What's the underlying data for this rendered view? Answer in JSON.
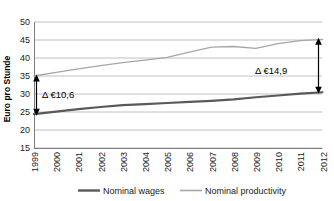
{
  "chart_data": {
    "type": "line",
    "title": "",
    "xlabel": "",
    "ylabel": "Euro pro Stunde",
    "ylim": [
      15,
      50
    ],
    "yticks": [
      15,
      20,
      25,
      30,
      35,
      40,
      45,
      50
    ],
    "grid": true,
    "legend_position": "bottom",
    "categories": [
      "1999",
      "2000",
      "2001",
      "2002",
      "2003",
      "2004",
      "2005",
      "2006",
      "2007",
      "2008",
      "2009",
      "2010",
      "2011",
      "2012"
    ],
    "series": [
      {
        "name": "Nominal wages",
        "color": "#595959",
        "values": [
          24.4,
          25.1,
          25.8,
          26.4,
          26.9,
          27.2,
          27.5,
          27.8,
          28.1,
          28.5,
          29.1,
          29.6,
          30.1,
          30.5
        ]
      },
      {
        "name": "Nominal productivity",
        "color": "#a6a6a6",
        "values": [
          35.0,
          36.0,
          37.0,
          37.9,
          38.7,
          39.4,
          40.2,
          41.6,
          43.0,
          43.2,
          42.7,
          44.0,
          44.8,
          45.2
        ]
      }
    ],
    "annotations": [
      {
        "name": "gap-1999",
        "text": "Δ €10,6",
        "value": 10.6,
        "at_category": "1999"
      },
      {
        "name": "gap-2012",
        "text": "Δ €14,9",
        "value": 14.9,
        "at_category": "2012"
      }
    ]
  },
  "axis": {
    "ylabel": "Euro pro Stunde",
    "ytick_labels": [
      "50",
      "45",
      "40",
      "35",
      "30",
      "25",
      "20",
      "15"
    ],
    "xtick_labels": [
      "1999",
      "2000",
      "2001",
      "2002",
      "2003",
      "2004",
      "2005",
      "2006",
      "2007",
      "2008",
      "2009",
      "2010",
      "2011",
      "2012"
    ]
  },
  "legend": {
    "items": [
      {
        "label": "Nominal wages"
      },
      {
        "label": "Nominal productivity"
      }
    ]
  },
  "annotations": {
    "left": "Δ €10,6",
    "right": "Δ €14,9"
  }
}
